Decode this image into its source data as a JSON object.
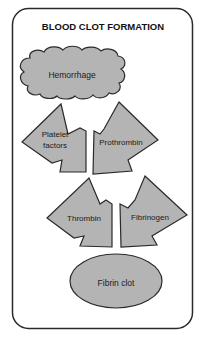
{
  "diagram": {
    "title": "BLOOD CLOT FORMATION",
    "nodes": {
      "hemorrhage": {
        "label": "Hemorrhage",
        "shape": "cloud"
      },
      "platelet_factors": {
        "line1": "Platelet",
        "line2": "factors",
        "shape": "arrow"
      },
      "prothrombin": {
        "label": "Prothrombin",
        "shape": "arrow"
      },
      "thrombin": {
        "label": "Thrombin",
        "shape": "arrow"
      },
      "fibrinogen": {
        "label": "Fibrinogen",
        "shape": "arrow"
      },
      "fibrin_clot": {
        "label": "Fibrin clot",
        "shape": "ellipse"
      }
    },
    "flow": [
      [
        "Hemorrhage",
        "Platelet factors"
      ],
      [
        "Hemorrhage",
        "Prothrombin"
      ],
      [
        "Platelet factors",
        "Thrombin"
      ],
      [
        "Prothrombin",
        "Thrombin"
      ],
      [
        "Thrombin",
        "Fibrin clot"
      ],
      [
        "Fibrinogen",
        "Fibrin clot"
      ]
    ],
    "colors": {
      "shape_fill": "#b4b4b4",
      "stroke": "#2a2a2a",
      "background": "#ffffff"
    }
  }
}
